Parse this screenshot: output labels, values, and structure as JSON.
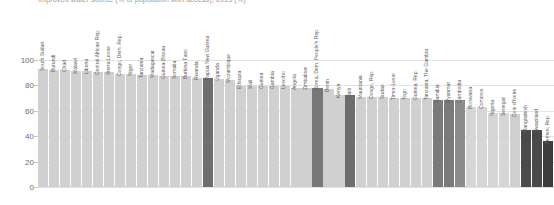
{
  "chart_data": {
    "type": "bar",
    "title": "Improved water source (% of population with access), 2015 (%)",
    "xlabel": "",
    "ylabel": "",
    "ylim": [
      0,
      110
    ],
    "grid": true,
    "legend": null,
    "yticks": [
      0,
      20,
      40,
      60,
      80,
      100
    ],
    "categories": [
      "South Sudan",
      "Burundi",
      "Chad",
      "Malawi",
      "Liberia",
      "Central African Rep.",
      "Sierra Leone",
      "Congo, Dem. Rep.",
      "Niger",
      "Tanzania",
      "Madagascar",
      "Guinea-Bissau",
      "Somalia",
      "Burkina Faso",
      "Rwanda",
      "Papua New Guinea",
      "Uganda",
      "Mozambique",
      "Ethiopia",
      "Mali",
      "Guinea",
      "Gambia",
      "Lesotho",
      "Angola",
      "Zimbabwe",
      "Korea, Dem. People's Rep.",
      "Benin",
      "Kenya",
      "Haiti",
      "Mauritania",
      "Congo, Rep.",
      "Sudan",
      "Timor-Leste",
      "Togo",
      "Guinea, Rep.",
      "Tanzania, The Gambia",
      "Namibia",
      "Myanmar",
      "Cambodia",
      "Botswana",
      "Comoros",
      "Nigeria",
      "Senegal",
      "Cote d'Ivoire",
      "Bangladesh",
      "Swaziland",
      "Yemen, Rep."
    ],
    "values": [
      93,
      92,
      92,
      91,
      91,
      90,
      90,
      89,
      89,
      88,
      88,
      87,
      87,
      87,
      86,
      86,
      85,
      84,
      79,
      79,
      79,
      79,
      79,
      78,
      78,
      78,
      77,
      72,
      72,
      71,
      71,
      71,
      70,
      70,
      70,
      70,
      68,
      68,
      68,
      63,
      63,
      58,
      58,
      57,
      45,
      45,
      36
    ],
    "bar_colors": [
      "#d0d0d0",
      "#d0d0d0",
      "#d0d0d0",
      "#d0d0d0",
      "#d0d0d0",
      "#d0d0d0",
      "#d0d0d0",
      "#d0d0d0",
      "#d0d0d0",
      "#d0d0d0",
      "#d0d0d0",
      "#d0d0d0",
      "#d0d0d0",
      "#d0d0d0",
      "#d0d0d0",
      "#6e6e6e",
      "#d0d0d0",
      "#d0d0d0",
      "#d0d0d0",
      "#d0d0d0",
      "#d0d0d0",
      "#d0d0d0",
      "#d0d0d0",
      "#d0d0d0",
      "#d0d0d0",
      "#787878",
      "#d0d0d0",
      "#d0d0d0",
      "#6e6e6e",
      "#d0d0d0",
      "#d0d0d0",
      "#d0d0d0",
      "#d0d0d0",
      "#d0d0d0",
      "#d0d0d0",
      "#d0d0d0",
      "#7a7a7a",
      "#7a7a7a",
      "#8c8c8c",
      "#d6d6d6",
      "#d6d6d6",
      "#d6d6d6",
      "#d6d6d6",
      "#cfcfcf",
      "#4a4a4a",
      "#4a4a4a",
      "#3d3d3d"
    ]
  },
  "axis": {
    "tick_labels": [
      "100",
      "80",
      "60",
      "40",
      "20",
      "0"
    ]
  },
  "colors": {
    "bar_light": "#d0d0d0",
    "bar_mid": "#7a7a7a",
    "bar_dark": "#4a4a4a",
    "grid": "#e2e2e2",
    "text": "#5e5e5e",
    "title": "#9a9a9a"
  }
}
